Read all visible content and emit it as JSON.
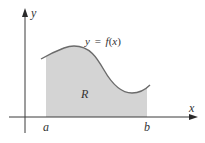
{
  "diagram": {
    "type": "area-under-curve",
    "axes": {
      "x_label": "x",
      "y_label": "y"
    },
    "curve_label": "y = f(x)",
    "curve_label_parts": {
      "lhs": "y",
      "eq": "=",
      "fn": "f",
      "open": "(",
      "arg": "x",
      "close": ")"
    },
    "region_label": "R",
    "bounds": {
      "left": "a",
      "right": "b"
    },
    "colors": {
      "axis": "#3a3a3a",
      "curve": "#6b6b6b",
      "fill": "#d4d4d4",
      "background": "#ffffff",
      "text": "#333333"
    }
  }
}
